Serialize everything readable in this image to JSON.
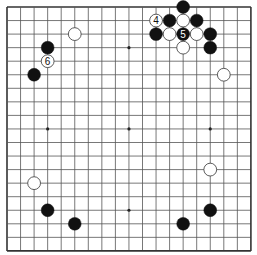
{
  "board": {
    "size": 19,
    "origin_x": 7,
    "origin_y": 7,
    "spacing": 13.55,
    "line_color": "#555555",
    "border_color": "#333333",
    "star_points": [
      [
        3,
        9
      ],
      [
        9,
        3
      ],
      [
        9,
        9
      ],
      [
        9,
        15
      ],
      [
        15,
        9
      ]
    ],
    "stone_colors": {
      "black": "#111111",
      "white": "#ffffff"
    }
  },
  "stones": [
    {
      "color": "white",
      "col": 5,
      "row": 2,
      "label": ""
    },
    {
      "color": "black",
      "col": 3,
      "row": 3,
      "label": ""
    },
    {
      "color": "white",
      "col": 3,
      "row": 4,
      "label": "6"
    },
    {
      "color": "black",
      "col": 2,
      "row": 5,
      "label": ""
    },
    {
      "color": "black",
      "col": 13,
      "row": 0,
      "label": ""
    },
    {
      "color": "white",
      "col": 11,
      "row": 1,
      "label": "4"
    },
    {
      "color": "black",
      "col": 12,
      "row": 1,
      "label": ""
    },
    {
      "color": "white",
      "col": 13,
      "row": 1,
      "label": ""
    },
    {
      "color": "black",
      "col": 14,
      "row": 1,
      "label": ""
    },
    {
      "color": "black",
      "col": 11,
      "row": 2,
      "label": ""
    },
    {
      "color": "white",
      "col": 12,
      "row": 2,
      "label": ""
    },
    {
      "color": "black",
      "col": 13,
      "row": 2,
      "label": "5"
    },
    {
      "color": "white",
      "col": 14,
      "row": 2,
      "label": ""
    },
    {
      "color": "black",
      "col": 15,
      "row": 2,
      "label": ""
    },
    {
      "color": "white",
      "col": 13,
      "row": 3,
      "label": ""
    },
    {
      "color": "black",
      "col": 15,
      "row": 3,
      "label": ""
    },
    {
      "color": "white",
      "col": 16,
      "row": 5,
      "label": ""
    },
    {
      "color": "white",
      "col": 2,
      "row": 13,
      "label": ""
    },
    {
      "color": "black",
      "col": 3,
      "row": 15,
      "label": ""
    },
    {
      "color": "black",
      "col": 5,
      "row": 16,
      "label": ""
    },
    {
      "color": "white",
      "col": 15,
      "row": 12,
      "label": ""
    },
    {
      "color": "black",
      "col": 15,
      "row": 15,
      "label": ""
    },
    {
      "color": "black",
      "col": 13,
      "row": 16,
      "label": ""
    }
  ]
}
